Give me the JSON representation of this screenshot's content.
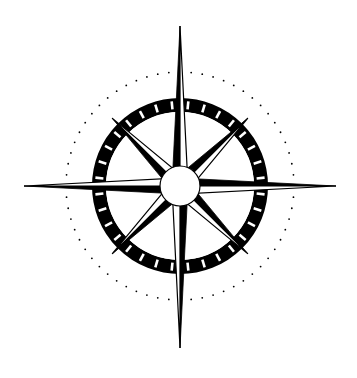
{
  "image": {
    "description": "Compass rose",
    "width": 357,
    "height": 378,
    "background": "#ffffff"
  },
  "compass": {
    "center": [
      180,
      186
    ],
    "ink_color": "#000000",
    "paper_color": "#ffffff",
    "dotted_circle_radius": 114,
    "dotted_circle_dot_count": 64,
    "ring_outer_radius": 88,
    "ring_inner_radius": 74,
    "ring_tick_count": 32,
    "hub_radius": 20,
    "cardinal_points": [
      {
        "name": "north",
        "angle": 0,
        "length": 160
      },
      {
        "name": "east",
        "angle": 90,
        "length": 156
      },
      {
        "name": "south",
        "angle": 180,
        "length": 162
      },
      {
        "name": "west",
        "angle": 270,
        "length": 156
      }
    ],
    "cardinal_half_width": 8,
    "intercardinal_points": [
      {
        "name": "northeast",
        "angle": 45,
        "length": 96
      },
      {
        "name": "southeast",
        "angle": 135,
        "length": 96
      },
      {
        "name": "southwest",
        "angle": 225,
        "length": 96
      },
      {
        "name": "northwest",
        "angle": 315,
        "length": 96
      }
    ],
    "intercardinal_half_width": 9
  }
}
